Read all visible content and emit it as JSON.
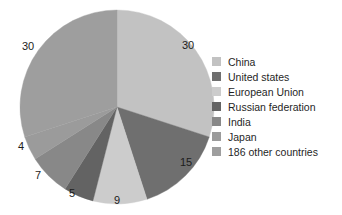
{
  "chart_data": {
    "type": "pie",
    "title": "",
    "xlabel": "",
    "ylabel": "",
    "categories": [
      "China",
      "United states",
      "European Union",
      "Russian federation",
      "India",
      "Japan",
      "186 other countries"
    ],
    "values": [
      30,
      15,
      9,
      5,
      7,
      4,
      30
    ],
    "value_labels": [
      "30",
      "15",
      "9",
      "5",
      "7",
      "4",
      "30"
    ],
    "colors": [
      "#c2c2c2",
      "#6f6f6f",
      "#cccccc",
      "#636363",
      "#888888",
      "#9b9b9b",
      "#9e9e9e"
    ],
    "total": 100,
    "start_angle_deg": 0,
    "direction": "clockwise",
    "legend_position": "right",
    "grid": false,
    "labels_outside": true,
    "background": "#ffffff",
    "label_color": "#1c1c1c"
  },
  "legend": {
    "items": [
      {
        "label": "China",
        "color": "#c2c2c2"
      },
      {
        "label": "United states",
        "color": "#6f6f6f"
      },
      {
        "label": "European Union",
        "color": "#cccccc"
      },
      {
        "label": "Russian federation",
        "color": "#636363"
      },
      {
        "label": "India",
        "color": "#888888"
      },
      {
        "label": "Japan",
        "color": "#9b9b9b"
      },
      {
        "label": "186 other countries",
        "color": "#9e9e9e"
      }
    ]
  },
  "slice_labels": [
    {
      "text": "30",
      "x": 188,
      "y": 45
    },
    {
      "text": "15",
      "x": 186,
      "y": 162
    },
    {
      "text": "9",
      "x": 117,
      "y": 200
    },
    {
      "text": "5",
      "x": 72,
      "y": 193
    },
    {
      "text": "7",
      "x": 38,
      "y": 175
    },
    {
      "text": "4",
      "x": 21,
      "y": 146
    },
    {
      "text": "30",
      "x": 28,
      "y": 46
    }
  ]
}
